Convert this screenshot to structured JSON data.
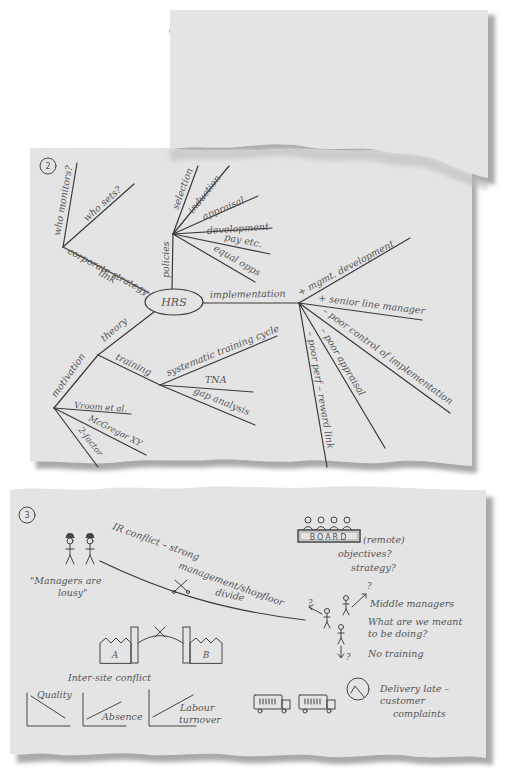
{
  "colors": {
    "paper": "#e4e4e4",
    "paper_shadow": "#a9a9a9",
    "ink": "#3a3a3a",
    "text": "#555555",
    "background": "#ffffff"
  },
  "page1": {
    "number": "1",
    "lines": [
      "Corporate Strategy – HRS link clarity of objectives",
      "Is there an HRS? (Boss doubts it)",
      "Policies – appraisal, staff devpt, recruitment,",
      "Indicators – productivity, quality, turnover",
      "Monitoring – feedback loop-2nd order?",
      "Barriers to own/subordinate perf:",
      "  – no feedback, unclear objs.",
      "  – no training, no pbr.",
      "Line v. Personnel"
    ]
  },
  "page2": {
    "number": "2",
    "center_node": "HRS",
    "branches": {
      "corporate_strategy": {
        "label_line1": "corporate strategy",
        "label_line2": "link",
        "children": [
          "who monitors?",
          "who sets?"
        ]
      },
      "policies": {
        "label": "policies",
        "children": [
          "selection",
          "induction",
          "appraisal",
          "development",
          "pay etc.",
          "equal opps"
        ]
      },
      "implementation": {
        "label": "implementation",
        "children": [
          "+ mgmt. development",
          "+ senior line manager",
          "– poor control of implementation",
          "– poor appraisal",
          "– poor perf – reward link"
        ]
      },
      "theory": {
        "label": "theory",
        "sub": {
          "motivation": {
            "label": "motivation",
            "children": [
              "Vroom et al.",
              "McGregor XY",
              "2-factor"
            ]
          },
          "training": {
            "label": "training",
            "children": [
              "systematic training cycle",
              "TNA",
              "gap analysis"
            ]
          }
        }
      }
    }
  },
  "page3": {
    "number": "3",
    "workers_quote_line1": "\"Managers are",
    "workers_quote_line2": "lousy\"",
    "ir_conflict_line1": "IR conflict – strong",
    "ir_conflict_line2": "management/shopfloor",
    "ir_conflict_line3": "divide",
    "board": {
      "label": "BOARD",
      "remote": "(remote)",
      "q1": "objectives?",
      "q2": "strategy?"
    },
    "middle_managers": {
      "label": "Middle managers",
      "question_line1": "What are we meant",
      "question_line2": "to be doing?",
      "no_training": "No training",
      "question_mark": "?"
    },
    "sites": {
      "site_a": "A",
      "site_b": "B",
      "caption": "Inter-site conflict"
    },
    "mini_charts": [
      {
        "label": "Quality",
        "trend": "down"
      },
      {
        "label": "Absence",
        "trend": "up"
      },
      {
        "label_line1": "Labour",
        "label_line2": "turnover",
        "trend": "up"
      }
    ],
    "delivery": {
      "line1": "Delivery late –",
      "line2": "customer",
      "line3": "complaints"
    }
  }
}
